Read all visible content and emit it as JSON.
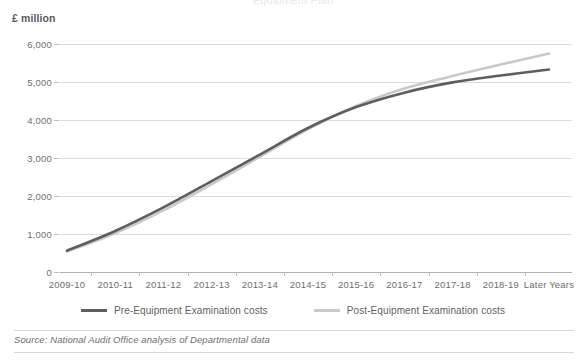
{
  "chart_data": {
    "type": "line",
    "title": "",
    "cut_off_header": "Equipment Plan",
    "xlabel": "",
    "ylabel": "£ million",
    "ylim": [
      0,
      6000
    ],
    "ytick_labels": [
      "0",
      "1,000",
      "2,000",
      "3,000",
      "4,000",
      "5,000",
      "6,000"
    ],
    "ytick_values": [
      0,
      1000,
      2000,
      3000,
      4000,
      5000,
      6000
    ],
    "grid": true,
    "legend_position": "bottom",
    "categories": [
      "2009-10",
      "2010-11",
      "2011-12",
      "2012-13",
      "2013-14",
      "2014-15",
      "2015-16",
      "2016-17",
      "2017-18",
      "2018-19",
      "Later Years"
    ],
    "series": [
      {
        "name": "Pre-Equipment Examination costs",
        "color": "#5e5e5e",
        "values": [
          560,
          1080,
          1700,
          2390,
          3090,
          3790,
          4340,
          4720,
          4990,
          5170,
          5330
        ]
      },
      {
        "name": "Post-Equipment Examination costs",
        "color": "#c9c9c9",
        "values": [
          540,
          1020,
          1620,
          2310,
          3030,
          3760,
          4370,
          4830,
          5160,
          5460,
          5750
        ]
      }
    ]
  },
  "axis": {
    "unit_label": "£ million"
  },
  "legend": {
    "items": [
      {
        "label": "Pre-Equipment Examination costs",
        "color": "#5e5e5e"
      },
      {
        "label": "Post-Equipment Examination costs",
        "color": "#c9c9c9"
      }
    ]
  },
  "footer": {
    "source": "Source: National Audit Office analysis of Departmental data"
  }
}
